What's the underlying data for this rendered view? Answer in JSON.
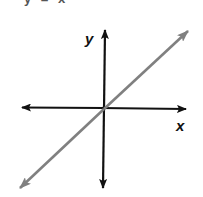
{
  "title_fragment": "y = x",
  "diagram": {
    "type": "coordinate-plane-line",
    "axes": {
      "x_label": "x",
      "y_label": "y"
    },
    "line": {
      "description": "line through origin with positive slope",
      "color": "#808080"
    },
    "colors": {
      "axes": "#111111",
      "line": "#808080",
      "background": "#ffffff"
    }
  }
}
